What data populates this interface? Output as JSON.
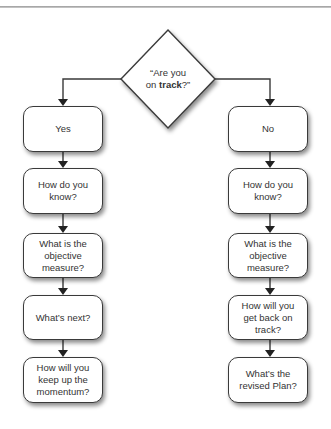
{
  "diagram": {
    "type": "flowchart",
    "decision": {
      "line1": "“Are you",
      "line2_prefix": "on ",
      "line2_bold": "track",
      "line2_suffix": "?”"
    },
    "branches": {
      "left": {
        "label": "Yes",
        "steps": [
          "How do you know?",
          "What is the objective measure?",
          "What’s next?",
          "How will you keep up the momentum?"
        ]
      },
      "right": {
        "label": "No",
        "steps": [
          "How do you know?",
          "What is the objective measure?",
          "How will you get back on track?",
          "What’s the revised Plan?"
        ]
      }
    },
    "colors": {
      "stroke": "#3a3a3a",
      "fill": "#ffffff",
      "text": "#333333"
    }
  }
}
